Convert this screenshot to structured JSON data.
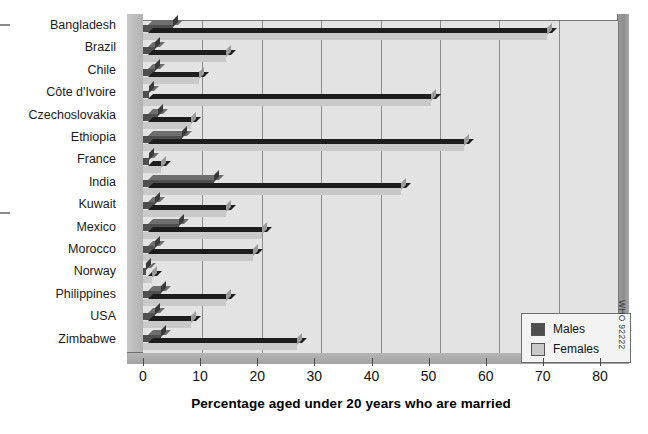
{
  "chart_data": {
    "type": "bar",
    "orientation": "horizontal",
    "title": "",
    "xlabel": "Percentage  aged under 20 years who are married",
    "ylabel": "",
    "xlim": [
      0,
      80
    ],
    "xticks": [
      0,
      10,
      20,
      30,
      40,
      50,
      60,
      70,
      80
    ],
    "grid": true,
    "legend_position": "bottom-right",
    "categories": [
      "Bangladesh",
      "Brazil",
      "Chile",
      "Côte d'Ivoire",
      "Czechoslovakia",
      "Ethiopia",
      "France",
      "India",
      "Kuwait",
      "Mexico",
      "Morocco",
      "Norway",
      "Philippines",
      "USA",
      "Zimbabwe"
    ],
    "series": [
      {
        "name": "Males",
        "color": "#4f4f4f",
        "values": [
          5,
          2,
          2,
          1,
          2.5,
          6.5,
          1,
          12,
          2,
          6,
          2,
          0.5,
          3,
          2,
          3
        ]
      },
      {
        "name": "Females",
        "color": "#c9c9c9",
        "values": [
          68,
          14,
          9.5,
          48.5,
          8,
          54,
          3,
          43.5,
          14,
          20,
          18.5,
          1.5,
          14,
          8,
          26
        ]
      }
    ]
  },
  "legend": {
    "items": [
      {
        "label": "Males",
        "color": "#4f4f4f"
      },
      {
        "label": "Females",
        "color": "#c9c9c9"
      }
    ]
  },
  "credit": "WHO 92222"
}
